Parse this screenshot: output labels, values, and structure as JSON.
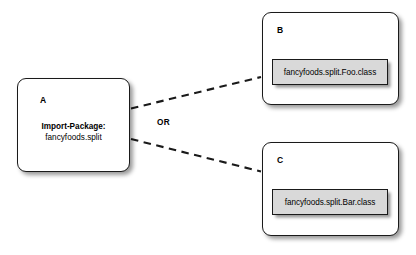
{
  "diagram": {
    "type": "osgi-bundle-wiring-diagram",
    "background_color": "#ffffff",
    "line_color": "#1a1a1a",
    "classbox_fill": "#d9d9d9"
  },
  "importer": {
    "label": "A",
    "manifest_key": "Import-Package:",
    "manifest_value": "fancyfoods.split"
  },
  "choice": {
    "label": "OR"
  },
  "providers": [
    {
      "label": "B",
      "class_file": "fancyfoods.split.Foo.class"
    },
    {
      "label": "C",
      "class_file": "fancyfoods.split.Bar.class"
    }
  ],
  "connectors": [
    {
      "name": "a-to-b",
      "style": "dashed",
      "from": "A",
      "to": "B"
    },
    {
      "name": "a-to-c",
      "style": "dashed",
      "from": "A",
      "to": "C"
    }
  ]
}
